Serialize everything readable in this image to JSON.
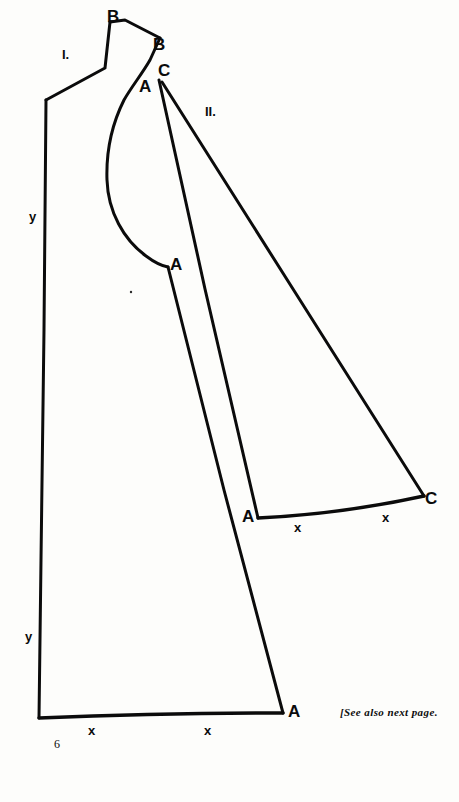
{
  "page": {
    "background_color": "#fdfdfb",
    "ink_color": "#0b0b0b",
    "folio": "6",
    "footnote": "[See also next page.",
    "width": 459,
    "height": 802
  },
  "pieces": [
    {
      "id": "piece-1",
      "label": "I.",
      "label_pos": [
        62,
        48
      ],
      "description": "front/back bodice and skirt panel with shoulder strap and armhole curve"
    },
    {
      "id": "piece-2",
      "label": "II.",
      "label_pos": [
        205,
        105
      ],
      "description": "narrow wedge/gore panel"
    }
  ],
  "point_labels": [
    {
      "name": "point-b-top",
      "text": "B",
      "x": 107,
      "y": 8
    },
    {
      "name": "point-b-strap-end",
      "text": "B",
      "x": 153,
      "y": 36
    },
    {
      "name": "point-c-apex",
      "text": "C",
      "x": 158,
      "y": 62
    },
    {
      "name": "point-a-apex",
      "text": "A",
      "x": 139,
      "y": 78
    },
    {
      "name": "point-a-underarm",
      "text": "A",
      "x": 170,
      "y": 256
    },
    {
      "name": "point-a-gore-left",
      "text": "A",
      "x": 242,
      "y": 508
    },
    {
      "name": "point-c-gore-right",
      "text": "C",
      "x": 425,
      "y": 490
    },
    {
      "name": "point-a-hem-right",
      "text": "A",
      "x": 288,
      "y": 703
    }
  ],
  "notch_marks": [
    {
      "name": "notch-piece1-hem-left",
      "text": "x",
      "x": 88,
      "y": 724
    },
    {
      "name": "notch-piece1-hem-right",
      "text": "x",
      "x": 204,
      "y": 724
    },
    {
      "name": "notch-piece2-hem-left",
      "text": "x",
      "x": 294,
      "y": 521
    },
    {
      "name": "notch-piece2-hem-right",
      "text": "x",
      "x": 382,
      "y": 511
    }
  ],
  "axis_marks": [
    {
      "name": "grainline-y-upper",
      "text": "y",
      "x": 29,
      "y": 210
    },
    {
      "name": "grainline-y-lower",
      "text": "y",
      "x": 25,
      "y": 630
    }
  ],
  "paths": {
    "piece1_outline": "M 125 20 L 160 38 L 152 57 C 146 66 140 72 134 80 C 120 98 110 130 108 160 C 106 196 120 232 145 256 C 155 264 162 266 168 267 L 283 713 L 39 718 L 46 103 L 105 68 L 110 22 Z",
    "piece1_armhole_note": "concave armhole curve on right side between strap base and point A",
    "piece2_outline": "M 160 80 L 258 518 L 272 518 L 300 515 L 340 510 L 380 504 L 424 497 Z",
    "piece2_left_edge": "M 160 80 L 258 518",
    "piece2_right_edge": "M 161 82 L 424 497",
    "piece2_hem": "M 258 518 L 424 497"
  }
}
